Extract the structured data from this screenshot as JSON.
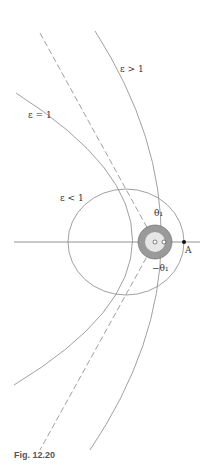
{
  "figure": {
    "caption": "Fig. 12.20",
    "labels": {
      "hyperbola": "ε > 1",
      "parabola": "ε = 1",
      "ellipse": "ε < 1",
      "theta_pos": "θ₁",
      "theta_neg": "−θ₁",
      "point": "A"
    },
    "colors": {
      "line": "#8a8a8a",
      "earth": "#9a9a9a",
      "text": "#333333"
    }
  }
}
